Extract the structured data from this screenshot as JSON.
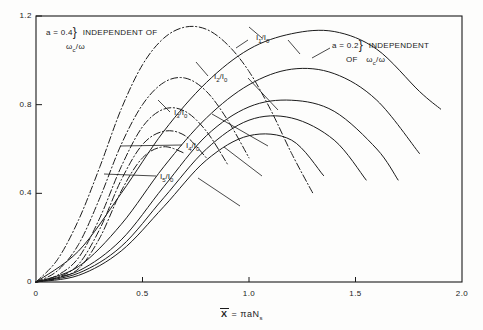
{
  "figure": {
    "background": "#fdfdfc",
    "ink": "#1b1b1b"
  },
  "axes": {
    "x_label": "X = πaN",
    "x_label_sub": "s",
    "x_label_overbar": true,
    "y_label": "",
    "x_ticks": [
      "0",
      "0.5",
      "1.0",
      "1.5",
      "2.0"
    ],
    "y_ticks": [
      "0",
      "0.4",
      "0.8",
      "1.2"
    ]
  },
  "annotations": {
    "left": {
      "line1": "a = 0.4",
      "brace": "}",
      "line1b": "INDEPENDENT   OF",
      "line2_main": "ω",
      "line2_sub": "c",
      "line2_rest": "/ω"
    },
    "right": {
      "line1": "a = 0.2",
      "brace": "}",
      "line1b": "INDEPENDENT",
      "line2_pre": "OF",
      "line2_main": "ω",
      "line2_sub": "c",
      "line2_rest": "/ω"
    }
  },
  "curve_labels": [
    {
      "id": "l1",
      "main": "I",
      "sub": "1",
      "rest": "/I",
      "rest_sub": "0",
      "x": 256,
      "y": 33
    },
    {
      "id": "l2",
      "main": "I",
      "sub": "2",
      "rest": "/I",
      "rest_sub": "0",
      "x": 214,
      "y": 72
    },
    {
      "id": "l3",
      "main": "I",
      "sub": "3",
      "rest": "/I",
      "rest_sub": "0",
      "x": 174,
      "y": 108
    },
    {
      "id": "l4",
      "main": "I",
      "sub": "4",
      "rest": "/I",
      "rest_sub": "0",
      "x": 186,
      "y": 141
    },
    {
      "id": "l5",
      "main": "I",
      "sub": "5",
      "rest": "/I",
      "rest_sub": "0",
      "x": 160,
      "y": 172
    }
  ],
  "chart_data": {
    "type": "line",
    "title": "",
    "xlabel": "X = πaN_s",
    "ylabel": "",
    "xlim": [
      0,
      2.0
    ],
    "ylim": [
      0,
      1.2
    ],
    "grid": false,
    "legend": "annotation-labels",
    "xticks": [
      0,
      0.5,
      1.0,
      1.5,
      2.0
    ],
    "yticks": [
      0,
      0.4,
      0.8,
      1.2
    ],
    "families": [
      {
        "name": "a = 0.2",
        "style": "solid",
        "note": "INDEPENDENT OF ωc/ω"
      },
      {
        "name": "a = 0.4",
        "style": "dash-dot",
        "note": "INDEPENDENT OF ωc/ω"
      }
    ],
    "series": [
      {
        "name": "I1/I0",
        "family": "a = 0.4",
        "style": "dash-dot",
        "x": [
          0.0,
          0.1,
          0.2,
          0.3,
          0.4,
          0.5,
          0.6,
          0.7,
          0.8,
          0.9,
          1.0,
          1.1,
          1.2,
          1.3
        ],
        "y": [
          0.0,
          0.1,
          0.28,
          0.52,
          0.78,
          0.98,
          1.1,
          1.15,
          1.14,
          1.07,
          0.95,
          0.78,
          0.58,
          0.4
        ]
      },
      {
        "name": "I1/I0",
        "family": "a = 0.2",
        "style": "solid",
        "x": [
          0.0,
          0.2,
          0.4,
          0.6,
          0.8,
          1.0,
          1.2,
          1.4,
          1.6,
          1.8,
          1.9
        ],
        "y": [
          0.0,
          0.14,
          0.4,
          0.68,
          0.9,
          1.05,
          1.12,
          1.13,
          1.05,
          0.86,
          0.78
        ]
      },
      {
        "name": "I2/I0",
        "family": "a = 0.4",
        "style": "dash-dot",
        "x": [
          0.0,
          0.1,
          0.2,
          0.3,
          0.4,
          0.5,
          0.6,
          0.7,
          0.8,
          0.9,
          1.0
        ],
        "y": [
          0.0,
          0.05,
          0.17,
          0.38,
          0.62,
          0.8,
          0.9,
          0.92,
          0.86,
          0.73,
          0.56
        ]
      },
      {
        "name": "I2/I0",
        "family": "a = 0.2",
        "style": "solid",
        "x": [
          0.0,
          0.2,
          0.4,
          0.6,
          0.8,
          1.0,
          1.2,
          1.4,
          1.6,
          1.8
        ],
        "y": [
          0.0,
          0.07,
          0.26,
          0.52,
          0.74,
          0.89,
          0.96,
          0.94,
          0.82,
          0.58
        ]
      },
      {
        "name": "I3/I0",
        "family": "a = 0.4",
        "style": "dash-dot",
        "x": [
          0.0,
          0.1,
          0.2,
          0.3,
          0.4,
          0.5,
          0.6,
          0.7,
          0.8,
          0.9
        ],
        "y": [
          0.0,
          0.03,
          0.11,
          0.29,
          0.52,
          0.7,
          0.78,
          0.77,
          0.68,
          0.53
        ]
      },
      {
        "name": "I3/I0",
        "family": "a = 0.2",
        "style": "solid",
        "x": [
          0.0,
          0.2,
          0.4,
          0.6,
          0.8,
          1.0,
          1.2,
          1.4,
          1.6,
          1.7
        ],
        "y": [
          0.0,
          0.05,
          0.19,
          0.43,
          0.66,
          0.79,
          0.82,
          0.77,
          0.6,
          0.46
        ]
      },
      {
        "name": "I4/I0",
        "family": "a = 0.4",
        "style": "dash-dot",
        "x": [
          0.0,
          0.1,
          0.2,
          0.3,
          0.4,
          0.5,
          0.6,
          0.7,
          0.8
        ],
        "y": [
          0.0,
          0.02,
          0.08,
          0.24,
          0.46,
          0.62,
          0.68,
          0.66,
          0.56
        ]
      },
      {
        "name": "I4/I0",
        "family": "a = 0.2",
        "style": "solid",
        "x": [
          0.0,
          0.2,
          0.4,
          0.6,
          0.8,
          1.0,
          1.2,
          1.4,
          1.55
        ],
        "y": [
          0.0,
          0.04,
          0.16,
          0.38,
          0.6,
          0.73,
          0.74,
          0.64,
          0.46
        ]
      },
      {
        "name": "I5/I0",
        "family": "a = 0.4",
        "style": "dash-dot",
        "x": [
          0.0,
          0.1,
          0.2,
          0.3,
          0.4,
          0.5,
          0.6,
          0.7
        ],
        "y": [
          0.0,
          0.02,
          0.06,
          0.2,
          0.41,
          0.56,
          0.61,
          0.58
        ]
      },
      {
        "name": "I5/I0",
        "family": "a = 0.2",
        "style": "solid",
        "x": [
          0.0,
          0.2,
          0.4,
          0.6,
          0.8,
          1.0,
          1.2,
          1.35
        ],
        "y": [
          0.0,
          0.03,
          0.14,
          0.34,
          0.55,
          0.66,
          0.64,
          0.48
        ]
      }
    ]
  }
}
